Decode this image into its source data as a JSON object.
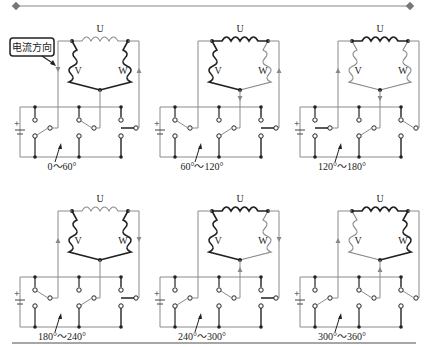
{
  "colors": {
    "dark": "#222222",
    "light": "#8a8a8a",
    "rule": "#777777"
  },
  "callout": {
    "text": "电流方向"
  },
  "phase_labels": {
    "u": "U",
    "v": "V",
    "w": "W"
  },
  "panels": [
    {
      "caption": "0～60°"
    },
    {
      "caption": "60°～120°"
    },
    {
      "caption": "120°～180°"
    },
    {
      "caption": "180°～240°"
    },
    {
      "caption": "240°～300°"
    },
    {
      "caption": "300°～360°"
    }
  ]
}
